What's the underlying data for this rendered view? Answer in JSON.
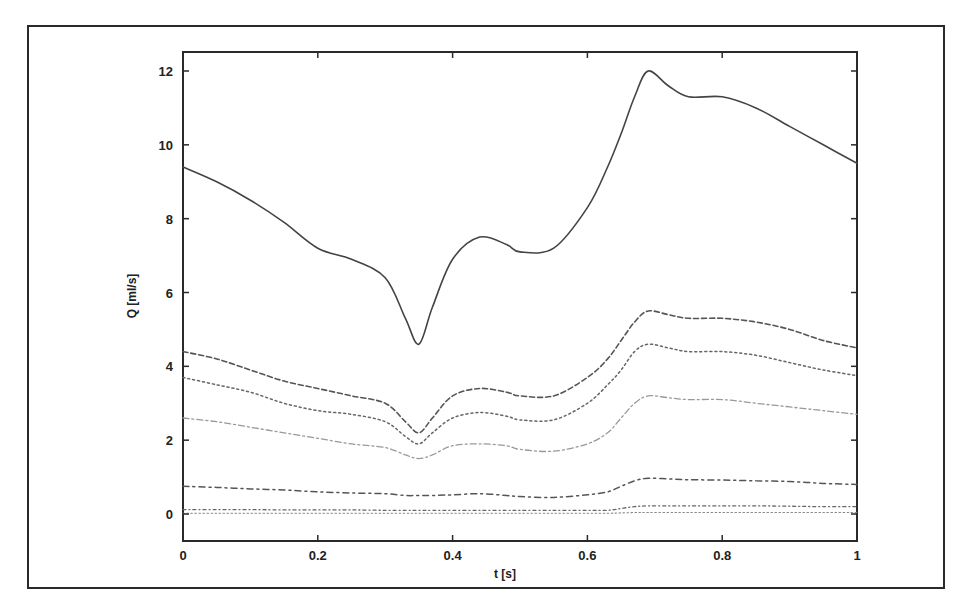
{
  "chart_data": {
    "type": "line",
    "title": "",
    "xlabel": "t [s]",
    "ylabel": "Q [ml/s]",
    "xlim": [
      0,
      1
    ],
    "ylim": [
      -0.5,
      12.5
    ],
    "xticks": [
      "0",
      "0.2",
      "0.4",
      "0.6",
      "0.8",
      "1"
    ],
    "yticks": [
      "0",
      "2",
      "4",
      "6",
      "8",
      "10",
      "12"
    ],
    "grid": false,
    "legend": null,
    "x": [
      0,
      0.05,
      0.1,
      0.15,
      0.2,
      0.25,
      0.3,
      0.33,
      0.35,
      0.37,
      0.4,
      0.44,
      0.48,
      0.5,
      0.55,
      0.6,
      0.63,
      0.65,
      0.67,
      0.69,
      0.72,
      0.75,
      0.8,
      0.85,
      0.9,
      0.95,
      1.0
    ],
    "series": [
      {
        "name": "total",
        "style": "solid",
        "values": [
          9.4,
          9.0,
          8.5,
          7.9,
          7.2,
          6.9,
          6.4,
          5.3,
          4.6,
          5.6,
          6.9,
          7.5,
          7.3,
          7.1,
          7.2,
          8.3,
          9.4,
          10.3,
          11.3,
          12.0,
          11.6,
          11.3,
          11.3,
          11.0,
          10.5,
          10.0,
          9.5
        ]
      },
      {
        "name": "branch-1",
        "style": "dashed",
        "values": [
          4.4,
          4.2,
          3.9,
          3.6,
          3.4,
          3.2,
          3.0,
          2.5,
          2.2,
          2.6,
          3.2,
          3.4,
          3.3,
          3.2,
          3.2,
          3.7,
          4.2,
          4.7,
          5.2,
          5.5,
          5.4,
          5.3,
          5.3,
          5.2,
          5.0,
          4.7,
          4.5
        ]
      },
      {
        "name": "branch-2",
        "style": "dotted",
        "values": [
          3.7,
          3.5,
          3.3,
          3.0,
          2.8,
          2.7,
          2.5,
          2.1,
          1.9,
          2.2,
          2.6,
          2.75,
          2.65,
          2.55,
          2.55,
          3.0,
          3.5,
          3.9,
          4.4,
          4.6,
          4.5,
          4.4,
          4.4,
          4.3,
          4.1,
          3.9,
          3.75
        ]
      },
      {
        "name": "branch-3",
        "style": "dash-dot-light",
        "values": [
          2.6,
          2.5,
          2.35,
          2.2,
          2.05,
          1.9,
          1.8,
          1.6,
          1.5,
          1.6,
          1.85,
          1.9,
          1.85,
          1.75,
          1.7,
          1.9,
          2.2,
          2.6,
          3.0,
          3.2,
          3.15,
          3.1,
          3.1,
          3.0,
          2.9,
          2.8,
          2.7
        ]
      },
      {
        "name": "branch-4",
        "style": "dash-dot",
        "values": [
          0.75,
          0.72,
          0.68,
          0.65,
          0.6,
          0.57,
          0.55,
          0.5,
          0.5,
          0.5,
          0.52,
          0.55,
          0.5,
          0.47,
          0.45,
          0.52,
          0.6,
          0.75,
          0.9,
          0.97,
          0.95,
          0.93,
          0.92,
          0.9,
          0.88,
          0.83,
          0.8
        ]
      },
      {
        "name": "branch-5",
        "style": "dash-dot-dense",
        "values": [
          0.12,
          0.12,
          0.12,
          0.11,
          0.11,
          0.11,
          0.1,
          0.1,
          0.1,
          0.1,
          0.1,
          0.1,
          0.1,
          0.1,
          0.1,
          0.1,
          0.1,
          0.15,
          0.2,
          0.22,
          0.22,
          0.22,
          0.22,
          0.22,
          0.21,
          0.2,
          0.2
        ]
      },
      {
        "name": "branch-6",
        "style": "dotted-fine",
        "values": [
          0.02,
          0.02,
          0.02,
          0.02,
          0.02,
          0.02,
          0.02,
          0.02,
          0.02,
          0.02,
          0.02,
          0.02,
          0.02,
          0.02,
          0.02,
          0.02,
          0.02,
          0.03,
          0.04,
          0.04,
          0.04,
          0.04,
          0.04,
          0.04,
          0.04,
          0.04,
          0.04
        ]
      }
    ]
  }
}
